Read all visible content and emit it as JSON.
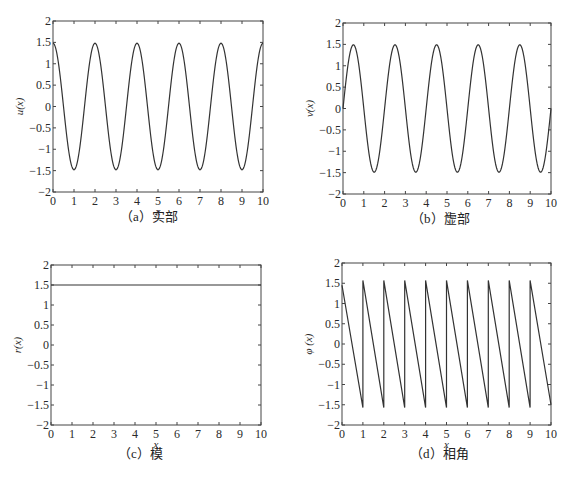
{
  "chart_data": [
    {
      "id": "a",
      "type": "line",
      "caption": "（a）实部",
      "xlabel": "x",
      "ylabel": "u(x)",
      "xlim": [
        0,
        10
      ],
      "ylim": [
        -2,
        2
      ],
      "xticks": [
        0,
        1,
        2,
        3,
        4,
        5,
        6,
        7,
        8,
        9,
        10
      ],
      "yticks": [
        -2,
        -1.5,
        -1,
        -0.5,
        0,
        0.5,
        1,
        1.5,
        2
      ],
      "ytick_labels": [
        "−2",
        "−1.5",
        "−1",
        "−0.5",
        "0",
        "0.5",
        "1",
        "1.5",
        "2"
      ],
      "grid": false,
      "function": "1.5*cos(pi*x)",
      "x": [
        0,
        0.5,
        1,
        1.5,
        2,
        2.5,
        3,
        3.5,
        4,
        4.5,
        5,
        5.5,
        6,
        6.5,
        7,
        7.5,
        8,
        8.5,
        9,
        9.5,
        10
      ],
      "values": [
        1.5,
        0,
        -1.5,
        0,
        1.4,
        0,
        -1.5,
        0,
        1.5,
        0,
        -1.5,
        0,
        1.45,
        0,
        -1.5,
        0,
        1.45,
        0,
        -1.5,
        0,
        1.5
      ]
    },
    {
      "id": "b",
      "type": "line",
      "caption": "（b）虚部",
      "xlabel": "x",
      "ylabel": "v(x)",
      "xlim": [
        0,
        10
      ],
      "ylim": [
        -2,
        2
      ],
      "xticks": [
        0,
        1,
        2,
        3,
        4,
        5,
        6,
        7,
        8,
        9,
        10
      ],
      "yticks": [
        -2,
        -1.5,
        -1,
        -0.5,
        0,
        0.5,
        1,
        1.5,
        2
      ],
      "ytick_labels": [
        "−2",
        "−1.5",
        "−1",
        "−0.5",
        "0",
        "0.5",
        "1",
        "1.5",
        "2"
      ],
      "grid": false,
      "function": "1.5*sin(pi*x)",
      "x": [
        0,
        0.5,
        1,
        1.5,
        2,
        2.5,
        3,
        3.5,
        4,
        4.5,
        5,
        5.5,
        6,
        6.5,
        7,
        7.5,
        8,
        8.5,
        9,
        9.5,
        10
      ],
      "values": [
        0,
        1.5,
        0,
        -1.5,
        0,
        1.5,
        0,
        -1.5,
        0,
        1.5,
        0,
        -1.5,
        0,
        1.5,
        0,
        -1.5,
        0,
        1.5,
        0,
        -1.5,
        0
      ]
    },
    {
      "id": "c",
      "type": "line",
      "caption": "（c）模",
      "xlabel": "x",
      "ylabel": "r(x)",
      "xlim": [
        0,
        10
      ],
      "ylim": [
        -2,
        2
      ],
      "xticks": [
        0,
        1,
        2,
        3,
        4,
        5,
        6,
        7,
        8,
        9,
        10
      ],
      "yticks": [
        -2,
        -1.5,
        -1,
        -0.5,
        0,
        0.5,
        1,
        1.5,
        2
      ],
      "ytick_labels": [
        "−2",
        "−1.5",
        "−1",
        "−0.5",
        "0",
        "0.5",
        "1",
        "1.5",
        "2"
      ],
      "grid": false,
      "function": "1.5",
      "x": [
        0,
        10
      ],
      "values": [
        1.5,
        1.5
      ]
    },
    {
      "id": "d",
      "type": "line",
      "caption": "（d）相角",
      "xlabel": "x",
      "ylabel": "φ (x)",
      "xlim": [
        0,
        10
      ],
      "ylim": [
        -2,
        2
      ],
      "xticks": [
        0,
        1,
        2,
        3,
        4,
        5,
        6,
        7,
        8,
        9,
        10
      ],
      "yticks": [
        -2,
        -1.5,
        -1,
        -0.5,
        0,
        0.5,
        1,
        1.5,
        2
      ],
      "ytick_labels": [
        "−2",
        "−1.5",
        "−1",
        "−0.5",
        "0",
        "0.5",
        "1",
        "1.5",
        "2"
      ],
      "grid": false,
      "function": "sawtooth: linear from 1.57 down to -1.57 over each unit interval",
      "x": [
        0,
        1,
        1,
        2,
        2,
        3,
        3,
        4,
        4,
        5,
        5,
        6,
        6,
        7,
        7,
        8,
        8,
        9,
        9,
        10
      ],
      "values": [
        1.45,
        -1.57,
        1.57,
        -1.57,
        1.57,
        -1.57,
        1.57,
        -1.57,
        1.57,
        -1.57,
        1.57,
        -1.57,
        1.57,
        -1.57,
        1.57,
        -1.57,
        1.57,
        -1.57,
        1.57,
        -1.5
      ]
    }
  ],
  "layout": {
    "panels": [
      {
        "left": 53,
        "top": 21,
        "right": 263,
        "bottom": 192,
        "caption_x": 120,
        "caption_y": 214
      },
      {
        "left": 343,
        "top": 23,
        "right": 551,
        "bottom": 194,
        "caption_x": 411,
        "caption_y": 216
      },
      {
        "left": 51,
        "top": 265,
        "right": 261,
        "bottom": 425,
        "caption_x": 118,
        "caption_y": 451
      },
      {
        "left": 342,
        "top": 263,
        "right": 551,
        "bottom": 425,
        "caption_x": 410,
        "caption_y": 451
      }
    ],
    "line_color": "#333333",
    "axis_color": "#444444"
  }
}
